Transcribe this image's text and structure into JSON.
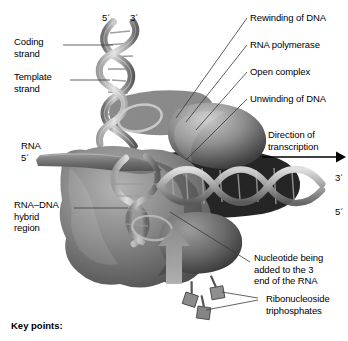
{
  "figure": {
    "background_color": "#ffffff",
    "text_color": "#000000",
    "leader_color": "#3a3a3a"
  },
  "labels": {
    "coding_strand": "Coding\nstrand",
    "template_strand": "Template\nstrand",
    "rna": "RNA",
    "rna_dna_hybrid": "RNA–DNA\nhybrid\nregion",
    "rewinding": "Rewinding of DNA",
    "rna_polymerase": "RNA polymerase",
    "open_complex": "Open complex",
    "unwinding": "Unwinding of DNA",
    "direction": "Direction of\ntranscription",
    "nucleotide_added": "Nucleotide being\nadded to the 3\nend of the RNA",
    "ribonucleoside": "Ribonucleoside\ntriphosphates",
    "key_points": "Key points:"
  },
  "primes": {
    "top_left_5": "5",
    "top_right_3": "3",
    "rna_5": "5",
    "right_3": "3",
    "right_5": "5",
    "prime_mark": "´"
  },
  "icons": {
    "direction_arrow": "arrow-right-icon",
    "nucleotide": "nucleotide-icon"
  },
  "colors": {
    "dna_ribbon_light": "#d6d6d6",
    "dna_ribbon_mid": "#9a9a9a",
    "dna_ribbon_dark": "#5e5e5e",
    "polymerase_gray": "#7d7d7d",
    "polymerase_dark": "#4a4a4a",
    "shadow_black": "#1a1a1a"
  }
}
